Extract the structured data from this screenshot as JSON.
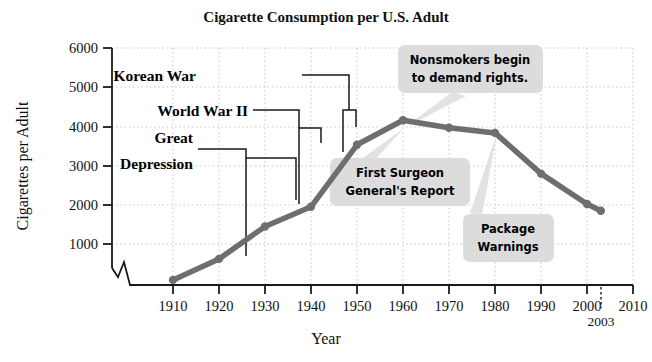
{
  "chart_data": {
    "type": "line",
    "title": "Cigarette Consumption per U.S. Adult",
    "xlabel": "Year",
    "ylabel": "Cigarettes per Adult",
    "x": [
      1910,
      1920,
      1930,
      1940,
      1950,
      1960,
      1970,
      1980,
      1990,
      2000,
      2003
    ],
    "values": [
      130,
      660,
      1480,
      1980,
      3550,
      4170,
      3980,
      3850,
      2820,
      2050,
      1880
    ],
    "xticks": [
      1910,
      1920,
      1930,
      1940,
      1950,
      1960,
      1970,
      1980,
      1990,
      2000,
      2010
    ],
    "yticks": [
      1000,
      2000,
      3000,
      4000,
      5000,
      6000
    ],
    "xlim": [
      1905,
      2012
    ],
    "ylim": [
      0,
      6000
    ],
    "grid": true,
    "legend": "none",
    "axis_break": true,
    "line_color": "#6e6e6e",
    "marker_color": "#5e5e5e",
    "extra_tick_label": "2003",
    "annotations": [
      {
        "id": "great-depression",
        "label_line1": "Great",
        "label_line2": "Depression",
        "style": "bracket",
        "span_start": 1929,
        "span_end": 1934,
        "top_value": 3290
      },
      {
        "id": "world-war-ii",
        "label_line1": "World War II",
        "label_line2": "",
        "style": "bracket",
        "span_start": 1941,
        "span_end": 1945,
        "top_value": 3970
      },
      {
        "id": "korean-war",
        "label_line1": "Korean War",
        "label_line2": "",
        "style": "bracket",
        "span_start": 1950,
        "span_end": 1953,
        "top_value": 4450
      },
      {
        "id": "first-surgeon-generals-report",
        "label_line1": "First Surgeon",
        "label_line2": "General's Report",
        "style": "callout",
        "points_to_year": 1964,
        "points_to_value": 4150
      },
      {
        "id": "nonsmokers-begin-to-demand-rights",
        "label_line1": "Nonsmokers begin",
        "label_line2": "to demand rights.",
        "style": "callout",
        "points_to_year": 1970,
        "points_to_value": 3980
      },
      {
        "id": "package-warnings",
        "label_line1": "Package",
        "label_line2": "Warnings",
        "style": "callout",
        "points_to_year": 1984,
        "points_to_value": 3500
      }
    ],
    "colors": {
      "line": "#6e6e6e",
      "grid": "#c8c8c8",
      "axis": "#1a1a1a",
      "callout_bg": "#dcdcdc",
      "bracket": "#1a1a1a"
    }
  }
}
